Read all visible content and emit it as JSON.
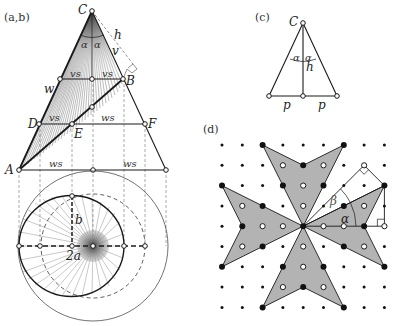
{
  "panels": {
    "ab": {
      "label": "(a,b)",
      "points": {
        "C": "C",
        "B": "B",
        "D": "D",
        "E": "E",
        "F": "F",
        "A": "A"
      },
      "segment_labels": {
        "alpha_left": "α",
        "alpha_right": "α",
        "h": "h",
        "v": "v",
        "w": "w",
        "vs_top_left": "vs",
        "vs_top_right": "vs",
        "vs_mid": "vs",
        "ws_mid": "ws",
        "ws_bottom_left": "ws",
        "ws_bottom_right": "ws",
        "b": "b",
        "two_a": "2a"
      }
    },
    "c": {
      "label": "(c)",
      "points": {
        "C": "C"
      },
      "segment_labels": {
        "alpha_left": "α",
        "alpha_right": "α",
        "h": "h",
        "p_left": "p",
        "p_right": "p"
      }
    },
    "d": {
      "label": "(d)",
      "angle_labels": {
        "alpha": "α",
        "beta": "β"
      },
      "grid": {
        "cols": 9,
        "rows": 9,
        "origin_x": 222,
        "origin_y": 145,
        "spacing": 20.3
      },
      "star_fill": "#b3b3b3"
    }
  },
  "colors": {
    "ink": "#1a1a1a",
    "fan": "#555555",
    "star_fill": "#b3b3b3",
    "dashed": "#777777"
  }
}
